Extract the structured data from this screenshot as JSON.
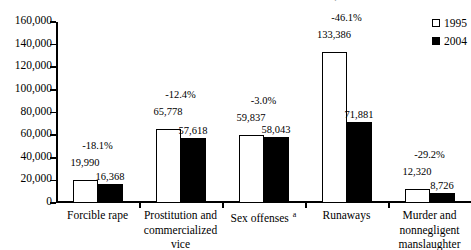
{
  "chart_data": {
    "type": "bar",
    "title": "ARREST TRENDS FOR SELECTED OFFENSES, 1995-2004",
    "xlabel": "",
    "ylabel": "",
    "ylim": [
      0,
      160000
    ],
    "ytick_values": [
      160000,
      140000,
      120000,
      100000,
      80000,
      60000,
      40000,
      20000,
      0
    ],
    "ytick_labels": [
      "160,000",
      "140,000",
      "120,000",
      "100,000",
      "80,000",
      "60,000",
      "40,000",
      "20,000",
      "0"
    ],
    "grid": false,
    "legend_position": "top-right",
    "categories": [
      "Forcible rape",
      "Prostitution and commercialized vice",
      "Sex offenses",
      "Runaways",
      "Murder and nonnegligent manslaughter"
    ],
    "category_lines": [
      [
        "Forcible rape"
      ],
      [
        "Prostitution and",
        "commercialized",
        "vice"
      ],
      [
        "Sex offenses"
      ],
      [
        "Runaways"
      ],
      [
        "Murder and",
        "nonnegligent",
        "manslaughter"
      ]
    ],
    "category_footnotes": [
      "",
      "",
      "a",
      "",
      ""
    ],
    "series": [
      {
        "name": "1995",
        "values": [
          19990,
          65778,
          59837,
          133386,
          12320
        ],
        "value_labels": [
          "19,990",
          "65,778",
          "59,837",
          "133,386",
          "12,320"
        ],
        "color": "#ffffff",
        "swatch": "hollow"
      },
      {
        "name": "2004",
        "values": [
          16368,
          57618,
          58043,
          71881,
          8726
        ],
        "value_labels": [
          "16,368",
          "57,618",
          "58,043",
          "71,881",
          "8,726"
        ],
        "color": "#000000",
        "swatch": "filled"
      }
    ],
    "annotations": {
      "percent_change_labels": [
        "-18.1%",
        "-12.4%",
        "-3.0%",
        "-46.1%",
        "-29.2%"
      ]
    }
  },
  "legend": {
    "items": [
      {
        "label": "1995",
        "swatch": "hollow"
      },
      {
        "label": "2004",
        "swatch": "filled"
      }
    ]
  }
}
